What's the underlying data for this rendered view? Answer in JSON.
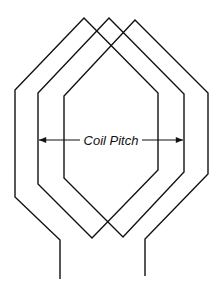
{
  "diagram": {
    "title": "",
    "label": "Coil Pitch",
    "stroke_color": "#111111",
    "background": "#ffffff",
    "winding_path": [
      [
        60,
        279
      ],
      [
        60,
        240
      ],
      [
        15,
        197
      ],
      [
        15,
        90
      ],
      [
        84,
        18
      ],
      [
        158,
        93
      ],
      [
        158,
        170
      ],
      [
        92,
        238
      ],
      [
        38,
        184
      ],
      [
        38,
        93
      ],
      [
        109,
        18
      ],
      [
        184,
        94
      ],
      [
        184,
        172
      ],
      [
        123,
        237
      ],
      [
        64,
        178
      ],
      [
        64,
        96
      ],
      [
        135,
        20
      ],
      [
        208,
        93
      ],
      [
        208,
        174
      ],
      [
        145,
        239
      ],
      [
        145,
        276
      ]
    ],
    "pitch_arrow": {
      "x1": 38,
      "x2": 184,
      "y": 140
    }
  }
}
